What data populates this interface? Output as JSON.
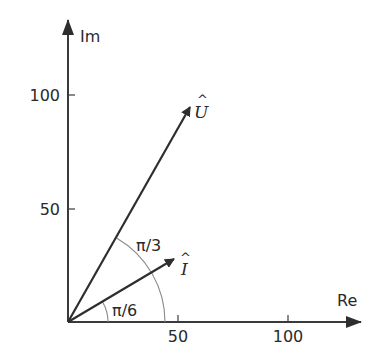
{
  "diagram": {
    "type": "phasor-diagram",
    "axes": {
      "x_label": "Re",
      "y_label": "Im",
      "x_ticks": [
        "50",
        "100"
      ],
      "y_ticks": [
        "50",
        "100"
      ]
    },
    "vectors": [
      {
        "name": "U",
        "label": "U",
        "hat": "^",
        "angle": "π/3",
        "approx_re": 55,
        "approx_im": 95
      },
      {
        "name": "I",
        "label": "I",
        "hat": "^",
        "angle": "π/6",
        "approx_re": 48,
        "approx_im": 28
      }
    ],
    "angle_labels": {
      "large": "π/3",
      "small": "π/6"
    },
    "colors": {
      "lines": "#2e2e2e",
      "arcs": "#8a8a8a",
      "text": "#2a2a2a"
    }
  }
}
